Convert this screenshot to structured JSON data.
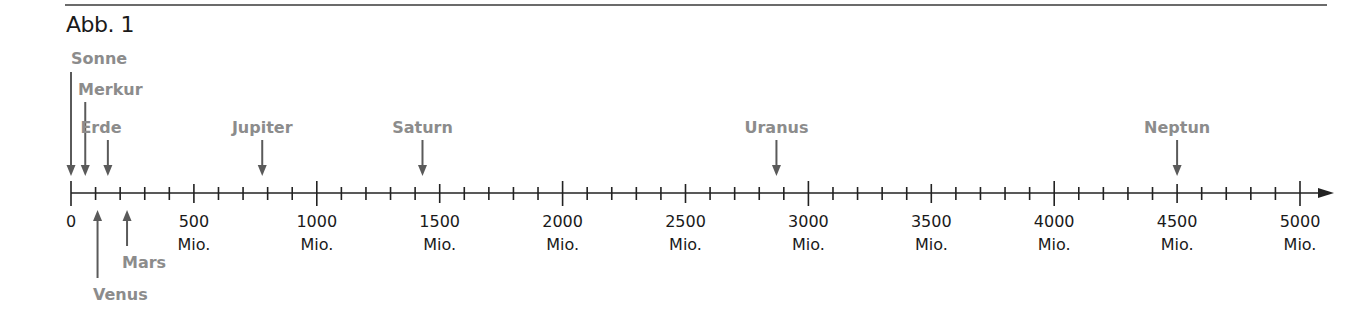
{
  "figure": {
    "title": "Abb. 1",
    "colors": {
      "axis": "#222222",
      "arrow": "#5a5a5a",
      "planet_label": "#8c8c8c",
      "tick_label": "#1a1a1a",
      "rule": "#6b6b6b"
    }
  },
  "chart_data": {
    "type": "number-line",
    "title": "Abb. 1",
    "unit_suffix": "Mio.",
    "axis_range": [
      0,
      5000
    ],
    "major_step": 500,
    "minor_step": 100,
    "tick_labels": [
      {
        "value": 0,
        "line1": "0",
        "line2": ""
      },
      {
        "value": 500,
        "line1": "500",
        "line2": "Mio."
      },
      {
        "value": 1000,
        "line1": "1000",
        "line2": "Mio."
      },
      {
        "value": 1500,
        "line1": "1500",
        "line2": "Mio."
      },
      {
        "value": 2000,
        "line1": "2000",
        "line2": "Mio."
      },
      {
        "value": 2500,
        "line1": "2500",
        "line2": "Mio."
      },
      {
        "value": 3000,
        "line1": "3000",
        "line2": "Mio."
      },
      {
        "value": 3500,
        "line1": "3500",
        "line2": "Mio."
      },
      {
        "value": 4000,
        "line1": "4000",
        "line2": "Mio."
      },
      {
        "value": 4500,
        "line1": "4500",
        "line2": "Mio."
      },
      {
        "value": 5000,
        "line1": "5000",
        "line2": "Mio."
      }
    ],
    "markers": [
      {
        "name": "Sonne",
        "value": 0,
        "side": "above"
      },
      {
        "name": "Merkur",
        "value": 58,
        "side": "above"
      },
      {
        "name": "Venus",
        "value": 108,
        "side": "below"
      },
      {
        "name": "Erde",
        "value": 150,
        "side": "above"
      },
      {
        "name": "Mars",
        "value": 228,
        "side": "below"
      },
      {
        "name": "Jupiter",
        "value": 778,
        "side": "above"
      },
      {
        "name": "Saturn",
        "value": 1430,
        "side": "above"
      },
      {
        "name": "Uranus",
        "value": 2870,
        "side": "above"
      },
      {
        "name": "Neptun",
        "value": 4500,
        "side": "above"
      }
    ]
  }
}
